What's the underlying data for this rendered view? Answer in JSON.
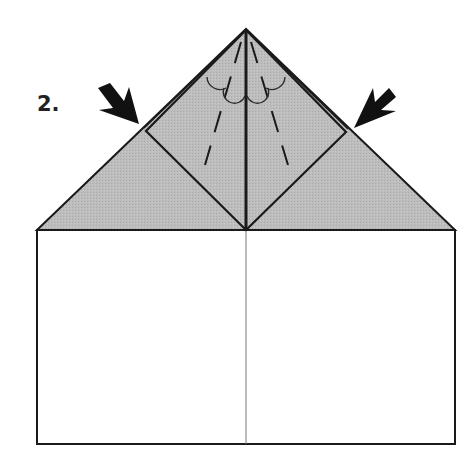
{
  "diagram": {
    "step_label": "2.",
    "type": "origami-fold-instruction",
    "colors": {
      "paper_front": "#ffffff",
      "paper_back": "#bdbdbd",
      "line": "#1a1a1a",
      "center_crease": "#777777"
    },
    "elements": [
      {
        "name": "square-paper",
        "shape": "rectangle"
      },
      {
        "name": "gray-triangle-flap",
        "shape": "triangle"
      },
      {
        "name": "diamond-fold",
        "shape": "square rotated 45deg"
      },
      {
        "name": "center-crease-line"
      },
      {
        "name": "left-dashed-fold-line"
      },
      {
        "name": "right-dashed-fold-line"
      },
      {
        "name": "left-push-arrow-icon"
      },
      {
        "name": "right-push-arrow-icon"
      },
      {
        "name": "fold-arc-marks"
      }
    ]
  }
}
